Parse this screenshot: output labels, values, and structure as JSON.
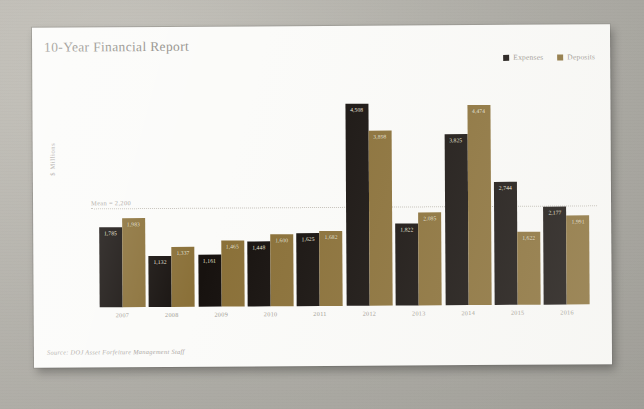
{
  "card": {
    "title": "10-Year Financial Report",
    "source_note": "Source: DOJ Asset Forfeiture Management Staff"
  },
  "legend": {
    "items": [
      {
        "label": "Expenses",
        "color": "#17120f"
      },
      {
        "label": "Deposits",
        "color": "#8a7038"
      }
    ]
  },
  "annotations": {
    "mean_label": "Mean = 2,200",
    "mean_value": 2200
  },
  "chart_data": {
    "type": "bar",
    "title": "10-Year Financial Report",
    "xlabel": "",
    "ylabel": "$ Millions",
    "ylim": [
      0,
      5000
    ],
    "grid": false,
    "legend_position": "top-right",
    "categories": [
      "2007",
      "2008",
      "2009",
      "2010",
      "2011",
      "2012",
      "2013",
      "2014",
      "2015",
      "2016"
    ],
    "series": [
      {
        "name": "Expenses",
        "color": "#17120f",
        "values": [
          1785,
          1132,
          1161,
          1448,
          1625,
          4508,
          1822,
          3825,
          2744,
          2177
        ],
        "labels": [
          "1,785",
          "1,132",
          "1,161",
          "1,448",
          "1,625",
          "4,508",
          "1,822",
          "3,825",
          "2,744",
          "2,177"
        ]
      },
      {
        "name": "Deposits",
        "color": "#8a7038",
        "values": [
          1983,
          1337,
          1465,
          1600,
          1682,
          3898,
          2085,
          4474,
          1622,
          1991
        ],
        "labels": [
          "1,983",
          "1,337",
          "1,465",
          "1,600",
          "1,682",
          "3,898",
          "2,085",
          "4,474",
          "1,622",
          "1,991"
        ]
      }
    ],
    "annotations": [
      {
        "type": "hline",
        "label": "Mean = 2,200",
        "value": 2200
      }
    ]
  }
}
